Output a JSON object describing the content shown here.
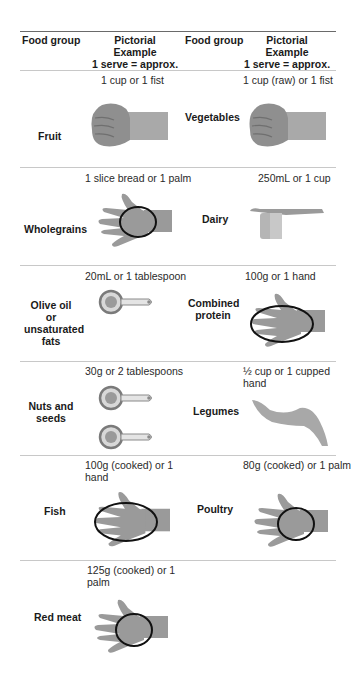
{
  "header": {
    "col1": "Food group",
    "col2_line1": "Pictorial",
    "col2_line2": "Example",
    "col2_line3": "1 serve = approx.",
    "col3": "Food group",
    "col4_line1": "Pictorial",
    "col4_line2": "Example",
    "col4_line3": "1 serve = approx."
  },
  "rows": [
    {
      "left": {
        "group": "Fruit",
        "serve": "1 cup or 1 fist",
        "picture": "fist-icon"
      },
      "right": {
        "group": "Vegetables",
        "serve": "1 cup (raw) or 1 fist",
        "picture": "fist-icon"
      }
    },
    {
      "left": {
        "group": "Wholegrains",
        "serve": "1 slice bread or 1 palm",
        "picture": "palm-icon"
      },
      "right": {
        "group": "Dairy",
        "serve": "250mL or 1 cup",
        "picture": "measuring-cup-icon"
      }
    },
    {
      "left": {
        "group_line1": "Olive oil or",
        "group_line2": "unsaturated",
        "group_line3": "fats",
        "serve": "20mL or 1 tablespoon",
        "picture": "tablespoon-icon"
      },
      "right": {
        "group_line1": "Combined",
        "group_line2": "protein",
        "serve": "100g or 1 hand",
        "picture": "hand-icon"
      }
    },
    {
      "left": {
        "group_line1": "Nuts and",
        "group_line2": "seeds",
        "serve": "30g or 2 tablespoons",
        "picture": "two-tablespoons-icon"
      },
      "right": {
        "group": "Legumes",
        "serve_line1": "½ cup or 1 cupped",
        "serve_line2": "hand",
        "picture": "cupped-hand-icon"
      }
    },
    {
      "left": {
        "group": "Fish",
        "serve_line1": "100g (cooked) or 1",
        "serve_line2": "hand",
        "picture": "hand-icon"
      },
      "right": {
        "group": "Poultry",
        "serve": "80g (cooked) or 1 palm",
        "picture": "palm-icon"
      }
    },
    {
      "left": {
        "group": "Red meat",
        "serve_line1": "125g (cooked) or 1",
        "serve_line2": "palm",
        "picture": "palm-icon"
      }
    }
  ],
  "colors": {
    "rule": "#6a6a6a",
    "separator": "#c8c8c8",
    "skin": "#9a9a9a",
    "ellipse": "#111111"
  }
}
